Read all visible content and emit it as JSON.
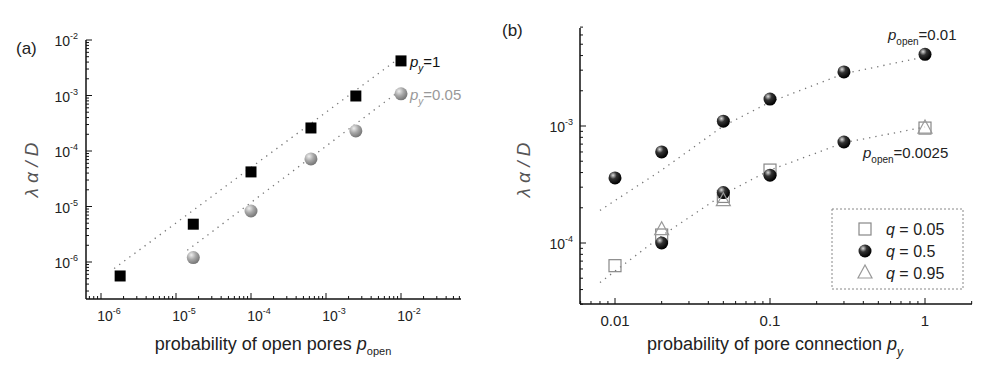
{
  "chart_data": [
    {
      "panel": "(a)",
      "type": "scatter",
      "xscale": "log",
      "yscale": "log",
      "xlabel": "probability of open pores p_open",
      "xlabel_main": "probability of open pores ",
      "xlabel_var": "p",
      "xlabel_sub": "open",
      "ylabel": "λ α / D",
      "xlim": [
        7e-07,
        0.06
      ],
      "ylim": [
        2.5e-07,
        0.01
      ],
      "x_ticks": [
        "10^-6",
        "10^-5",
        "10^-4",
        "10^-3",
        "10^-2"
      ],
      "y_ticks": [
        "10^-6",
        "10^-5",
        "10^-4",
        "10^-3",
        "10^-2"
      ],
      "grid": false,
      "series": [
        {
          "name": "p_y=1",
          "label_var": "p",
          "label_sub": "y",
          "label_val": "=1",
          "marker": "square",
          "color": "#000000",
          "fit_line": "dotted",
          "x": [
            1.8e-06,
            1.7e-05,
            0.0001,
            0.00063,
            0.0025,
            0.01
          ],
          "y": [
            5.6e-07,
            4.8e-06,
            4.2e-05,
            0.00026,
            0.00098,
            0.0042
          ]
        },
        {
          "name": "p_y=0.05",
          "label_var": "p",
          "label_sub": "y",
          "label_val": "=0.05",
          "marker": "circle",
          "color": "#999999",
          "fit_line": "dotted",
          "x": [
            1.7e-05,
            0.0001,
            0.00063,
            0.0025,
            0.01
          ],
          "y": [
            1.2e-06,
            8.3e-06,
            7.2e-05,
            0.00023,
            0.00107
          ]
        }
      ]
    },
    {
      "panel": "(b)",
      "type": "scatter",
      "xscale": "log",
      "yscale": "log",
      "xlabel": "probability of pore connection p_y",
      "xlabel_main": "probability of pore connection ",
      "xlabel_var": "p",
      "xlabel_sub": "y",
      "ylabel": "λ α / D",
      "xlim": [
        0.006,
        2.0
      ],
      "ylim": [
        3e-05,
        0.0075
      ],
      "x_ticks": [
        "0.01",
        "0.1",
        "1"
      ],
      "y_ticks": [
        "10^-4",
        "10^-3"
      ],
      "grid": false,
      "annotations": [
        {
          "var": "p",
          "sub": "open",
          "val": "=0.01"
        },
        {
          "var": "p",
          "sub": "open",
          "val": "=0.0025"
        }
      ],
      "legend": {
        "position": "lower right",
        "entries": [
          {
            "marker": "square",
            "label_var": "q",
            "label_val": " = 0.05"
          },
          {
            "marker": "circle",
            "label_var": "q",
            "label_val": " = 0.5"
          },
          {
            "marker": "triangle",
            "label_var": "q",
            "label_val": " = 0.95"
          }
        ]
      },
      "series": [
        {
          "name": "q = 0.5 (p_open=0.01)",
          "marker": "circle",
          "x": [
            0.01,
            0.02,
            0.05,
            0.1,
            0.3,
            1.0
          ],
          "y": [
            0.00036,
            0.0006,
            0.0011,
            0.0017,
            0.0029,
            0.0041
          ]
        },
        {
          "name": "q = 0.05 (p_open=0.0025)",
          "marker": "square",
          "x": [
            0.01,
            0.02,
            0.05,
            0.1,
            1.0
          ],
          "y": [
            6.4e-05,
            0.000117,
            0.00025,
            0.00042,
            0.00096
          ]
        },
        {
          "name": "q = 0.5 (p_open=0.0025)",
          "marker": "circle",
          "x": [
            0.02,
            0.05,
            0.1,
            0.3
          ],
          "y": [
            0.0001,
            0.00027,
            0.00038,
            0.00073
          ]
        },
        {
          "name": "q = 0.95 (p_open=0.0025)",
          "marker": "triangle",
          "x": [
            0.02,
            0.05,
            1.0
          ],
          "y": [
            0.00013,
            0.00023,
            0.00096
          ]
        }
      ],
      "fit_curves": [
        {
          "name": "p_open=0.01 fit",
          "x": [
            0.008,
            0.02,
            0.05,
            0.1,
            0.3,
            1.0
          ],
          "y": [
            0.00019,
            0.00042,
            0.001,
            0.0016,
            0.0028,
            0.0039
          ]
        },
        {
          "name": "p_open=0.0025 fit",
          "x": [
            0.008,
            0.02,
            0.05,
            0.1,
            0.3,
            1.0
          ],
          "y": [
            4.6e-05,
            0.000115,
            0.00026,
            0.00042,
            0.00072,
            0.00098
          ]
        }
      ]
    }
  ]
}
